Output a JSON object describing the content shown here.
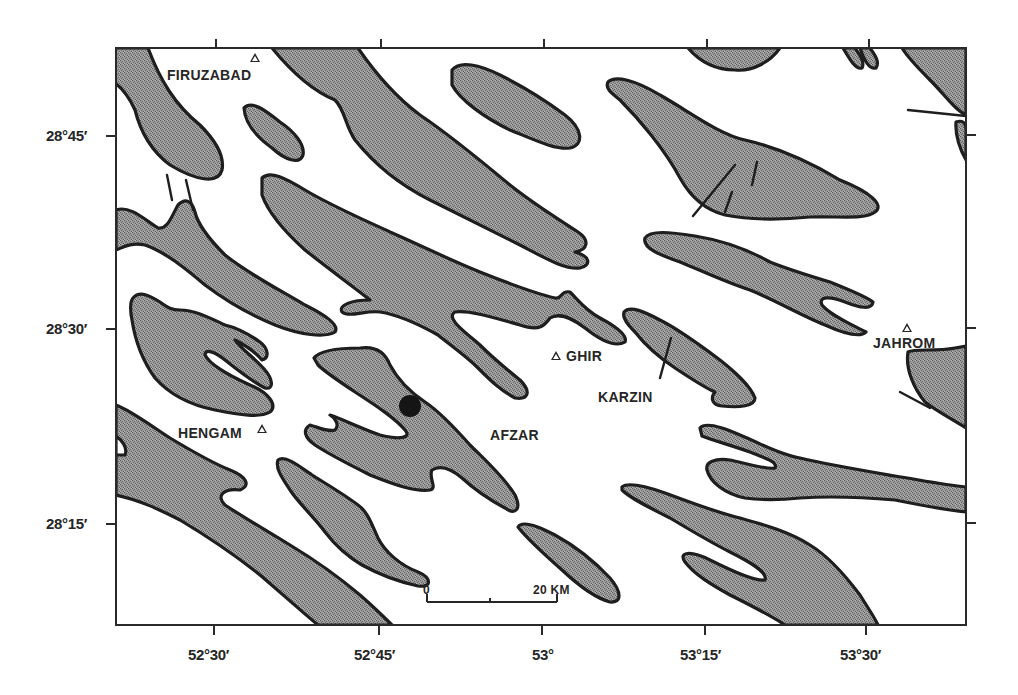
{
  "map": {
    "frame": {
      "left": 116,
      "top": 48,
      "right": 966,
      "bottom": 625
    },
    "colors": {
      "band_fill": "#8c8c8c",
      "band_stroke": "#1e1e1e",
      "background": "#ffffff",
      "text": "#262626"
    },
    "latitude_labels": [
      {
        "label": "28°45′",
        "y": 136
      },
      {
        "label": "28°30′",
        "y": 329
      },
      {
        "label": "28°15′",
        "y": 524
      }
    ],
    "longitude_labels": [
      {
        "label": "52°30′",
        "x": 214
      },
      {
        "label": "52°45′",
        "x": 379
      },
      {
        "label": "53°",
        "x": 542
      },
      {
        "label": "53°15′",
        "x": 705
      },
      {
        "label": "53°30′",
        "x": 866
      }
    ],
    "places": [
      {
        "name": "FIRUZABAD",
        "symbol": "triangle"
      },
      {
        "name": "GHIR",
        "symbol": "triangle"
      },
      {
        "name": "KARZIN",
        "symbol": "none"
      },
      {
        "name": "AFZAR",
        "symbol": "none"
      },
      {
        "name": "HENGAM",
        "symbol": "triangle"
      },
      {
        "name": "JAHROM",
        "symbol": "triangle"
      }
    ],
    "epicenter_marker": {
      "shape": "filled-circle",
      "x": 410,
      "y": 406
    },
    "scale_bar": {
      "start_label": "0",
      "end_label": "20 KM"
    }
  }
}
